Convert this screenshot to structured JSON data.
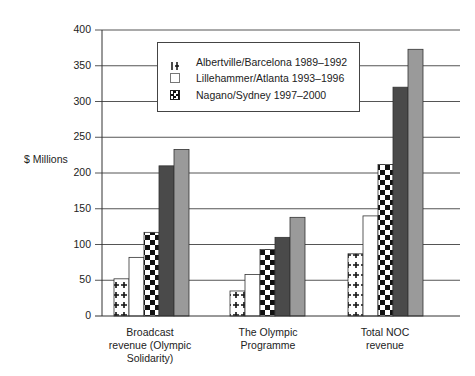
{
  "chart_data": {
    "type": "bar",
    "title": "",
    "xlabel": "",
    "ylabel": "$ Millions",
    "ylim": [
      0,
      400
    ],
    "yticks": [
      0,
      50,
      100,
      150,
      200,
      250,
      300,
      350,
      400
    ],
    "grid": true,
    "legend_position": "top-center inset",
    "categories": [
      "Broadcast revenue (Olympic Solidarity)",
      "The Olympic Programme",
      "Total NOC revenue"
    ],
    "category_label_lines": [
      [
        "Broadcast",
        "revenue (Olympic",
        "Solidarity)"
      ],
      [
        "The Olympic",
        "Programme"
      ],
      [
        "Total NOC",
        "revenue"
      ]
    ],
    "series": [
      {
        "name": "Albertville/Barcelona 1989–1992",
        "pattern": "crosses",
        "values": [
          52,
          35,
          87
        ],
        "in_legend": true
      },
      {
        "name": "Lillehammer/Atlanta 1993–1996",
        "pattern": "white",
        "values": [
          82,
          58,
          140
        ],
        "in_legend": true
      },
      {
        "name": "Nagano/Sydney 1997–2000",
        "pattern": "checker",
        "values": [
          117,
          93,
          212
        ],
        "in_legend": true
      },
      {
        "name": "Series 4 (unlabeled)",
        "pattern": "dark-gray",
        "values": [
          210,
          110,
          320
        ],
        "in_legend": false
      },
      {
        "name": "Series 5 (unlabeled)",
        "pattern": "light-gray",
        "values": [
          233,
          138,
          373
        ],
        "in_legend": false
      }
    ]
  },
  "legend": {
    "items": [
      {
        "label": "Albertville/Barcelona 1989–1992"
      },
      {
        "label": "Lillehammer/Atlanta 1993–1996"
      },
      {
        "label": "Nagano/Sydney 1997–2000"
      }
    ]
  },
  "axis": {
    "ylabel": "$ Millions",
    "ticks": [
      "0",
      "50",
      "100",
      "150",
      "200",
      "250",
      "300",
      "350",
      "400"
    ]
  },
  "colors": {
    "dark_gray": "#4a4a4a",
    "light_gray": "#9a9a9a",
    "grid": "#555555"
  }
}
